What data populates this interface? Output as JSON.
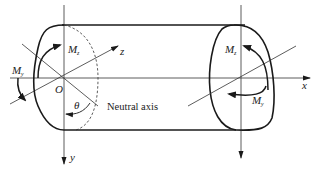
{
  "diagram": {
    "colors": {
      "stroke": "#1a1a1a",
      "thin_stroke": "#333333",
      "background": "#ffffff"
    },
    "labels": {
      "origin": "O",
      "axis_x": "x",
      "axis_y": "y",
      "axis_z": "z",
      "angle": "θ",
      "neutral_axis": "Neutral axis",
      "moment_left_z": {
        "base": "M",
        "sub": "z"
      },
      "moment_left_y": {
        "base": "M",
        "sub": "y"
      },
      "moment_right_z": {
        "base": "M",
        "sub": "z"
      },
      "moment_right_y": {
        "base": "M",
        "sub": "y"
      }
    }
  }
}
